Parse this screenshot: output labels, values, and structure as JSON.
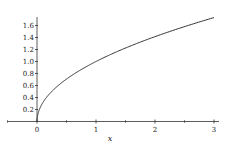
{
  "chart_data": {
    "type": "line",
    "title": "",
    "xlabel": "x",
    "ylabel": "",
    "function": "sqrt(x)",
    "xlim": [
      -0.5,
      3.05
    ],
    "ylim": [
      0,
      1.75
    ],
    "x_ticks": [
      0,
      1,
      2,
      3
    ],
    "x_tick_labels": [
      "0",
      "1",
      "2",
      "3"
    ],
    "y_ticks": [
      0.2,
      0.4,
      0.6,
      0.8,
      1.0,
      1.2,
      1.4,
      1.6
    ],
    "y_tick_labels": [
      "0.2",
      "0.4",
      "0.6",
      "0.8",
      "1.0",
      "1.2",
      "1.4",
      "1.6"
    ],
    "grid": false,
    "legend": null,
    "series": [
      {
        "name": "sqrt(x)",
        "x": [
          0,
          0.05,
          0.1,
          0.25,
          0.5,
          0.75,
          1,
          1.5,
          2,
          2.5,
          3
        ],
        "values": [
          0,
          0.224,
          0.316,
          0.5,
          0.707,
          0.866,
          1.0,
          1.225,
          1.414,
          1.581,
          1.732
        ],
        "color": "#333333"
      }
    ]
  }
}
